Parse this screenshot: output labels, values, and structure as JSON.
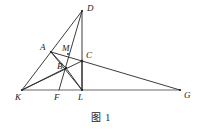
{
  "figure": {
    "caption": "图 1",
    "stroke_color": "#262626",
    "baseline_color": "#6b6b6b",
    "background_color": "#ffffff",
    "width": 202,
    "height": 138,
    "points": [
      {
        "id": "D",
        "label": "D",
        "x": 82,
        "y": 11,
        "label_x": 87,
        "label_y": 4
      },
      {
        "id": "A",
        "label": "A",
        "x": 51,
        "y": 52,
        "label_x": 40,
        "label_y": 43
      },
      {
        "id": "M",
        "label": "M",
        "x": 68,
        "y": 54,
        "label_x": 62,
        "label_y": 44
      },
      {
        "id": "C",
        "label": "C",
        "x": 82,
        "y": 61,
        "label_x": 86,
        "label_y": 51
      },
      {
        "id": "B",
        "label": "B",
        "x": 66,
        "y": 68,
        "label_x": 57,
        "label_y": 62
      },
      {
        "id": "K",
        "label": "K",
        "x": 22,
        "y": 90,
        "label_x": 15,
        "label_y": 93
      },
      {
        "id": "F",
        "label": "F",
        "x": 59,
        "y": 90,
        "label_x": 54,
        "label_y": 93
      },
      {
        "id": "L",
        "label": "L",
        "x": 82,
        "y": 90,
        "label_x": 78,
        "label_y": 93
      },
      {
        "id": "G",
        "label": "G",
        "x": 180,
        "y": 90,
        "label_x": 184,
        "label_y": 91
      }
    ],
    "segments": [
      {
        "name": "segment-K-D",
        "from": "K",
        "to": "D"
      },
      {
        "name": "segment-D-L",
        "from": "D",
        "to": "L"
      },
      {
        "name": "segment-D-F",
        "from": "D",
        "to": "F"
      },
      {
        "name": "segment-K-G",
        "from": "K",
        "to": "G"
      },
      {
        "name": "segment-K-C",
        "from": "K",
        "to": "C"
      },
      {
        "name": "segment-K-B",
        "from": "K",
        "to": "B"
      },
      {
        "name": "segment-A-L",
        "from": "A",
        "to": "L"
      },
      {
        "name": "segment-A-C",
        "from": "A",
        "to": "C"
      },
      {
        "name": "segment-A-B",
        "from": "A",
        "to": "B"
      },
      {
        "name": "segment-B-L",
        "from": "B",
        "to": "L"
      },
      {
        "name": "segment-C-G",
        "from": "C",
        "to": "G"
      },
      {
        "name": "segment-C-L",
        "from": "C",
        "to": "L"
      }
    ]
  }
}
